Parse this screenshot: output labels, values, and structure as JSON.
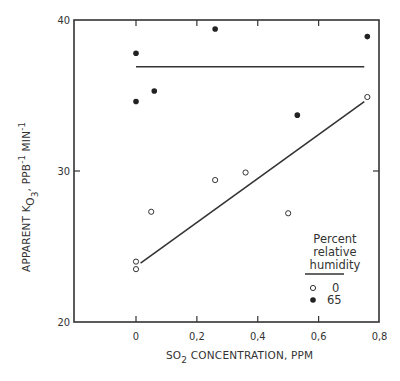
{
  "chart_data": {
    "type": "scatter",
    "title": "",
    "xlabel": "SO2 CONCENTRATION, PPM",
    "xlabel_parts": {
      "pre": "SO",
      "sub": "2",
      "post": " CONCENTRATION, PPM"
    },
    "ylabel": "APPARENT K_O3, PPB^-1 MIN^-1",
    "ylabel_parts": {
      "pre": "APPARENT K",
      "sub": "O",
      "subsub": "3",
      "mid": ", PPB",
      "sup1": "-1",
      "mid2": " MIN",
      "sup2": "-1"
    },
    "xlim": [
      -0.2,
      0.8
    ],
    "ylim": [
      20,
      40
    ],
    "x_ticks": [
      0,
      0.2,
      0.4,
      0.6,
      0.8
    ],
    "x_tick_labels": [
      "0",
      "0,2",
      "0,4",
      "0,6",
      "0,8"
    ],
    "y_ticks": [
      20,
      30,
      40
    ],
    "y_tick_labels": [
      "20",
      "30",
      "40"
    ],
    "grid": false,
    "legend": {
      "title_lines": [
        "Percent",
        "relative",
        "humidity"
      ],
      "position": "lower right",
      "entries": [
        {
          "marker": "open-circle",
          "label": "0"
        },
        {
          "marker": "filled-circle",
          "label": "65"
        }
      ]
    },
    "series": [
      {
        "name": "0",
        "marker": "open-circle",
        "points": [
          {
            "x": 0.0,
            "y": 24.0
          },
          {
            "x": 0.0,
            "y": 23.5
          },
          {
            "x": 0.05,
            "y": 27.3
          },
          {
            "x": 0.26,
            "y": 29.4
          },
          {
            "x": 0.36,
            "y": 29.9
          },
          {
            "x": 0.5,
            "y": 27.2
          },
          {
            "x": 0.76,
            "y": 34.9
          }
        ],
        "fit_line": {
          "x": [
            0.015,
            0.75
          ],
          "y": [
            23.9,
            34.6
          ]
        }
      },
      {
        "name": "65",
        "marker": "filled-circle",
        "points": [
          {
            "x": 0.0,
            "y": 37.8
          },
          {
            "x": 0.0,
            "y": 34.6
          },
          {
            "x": 0.06,
            "y": 35.3
          },
          {
            "x": 0.26,
            "y": 39.4
          },
          {
            "x": 0.53,
            "y": 33.7
          },
          {
            "x": 0.76,
            "y": 38.9
          }
        ],
        "fit_line": {
          "x": [
            0.0,
            0.75
          ],
          "y": [
            36.9,
            36.9
          ]
        }
      }
    ]
  }
}
